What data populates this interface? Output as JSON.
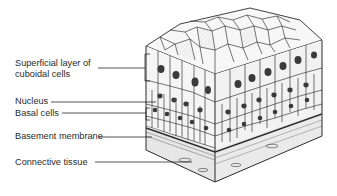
{
  "figure": {
    "labels": [
      {
        "id": "superficial",
        "line1": "Superficial layer of",
        "line2": "cuboidal cells"
      },
      {
        "id": "nucleus",
        "text": "Nucleus"
      },
      {
        "id": "basal",
        "text": "Basal cells"
      },
      {
        "id": "basement",
        "text": "Basement membrane"
      },
      {
        "id": "connective",
        "text": "Connective tissue"
      }
    ],
    "colors": {
      "ink": "#2a2a2a",
      "cell_fill": "#f4f4f4",
      "nucleus": "#3a3a3a",
      "shade": "#bdbdbd",
      "background": "#ffffff"
    }
  }
}
